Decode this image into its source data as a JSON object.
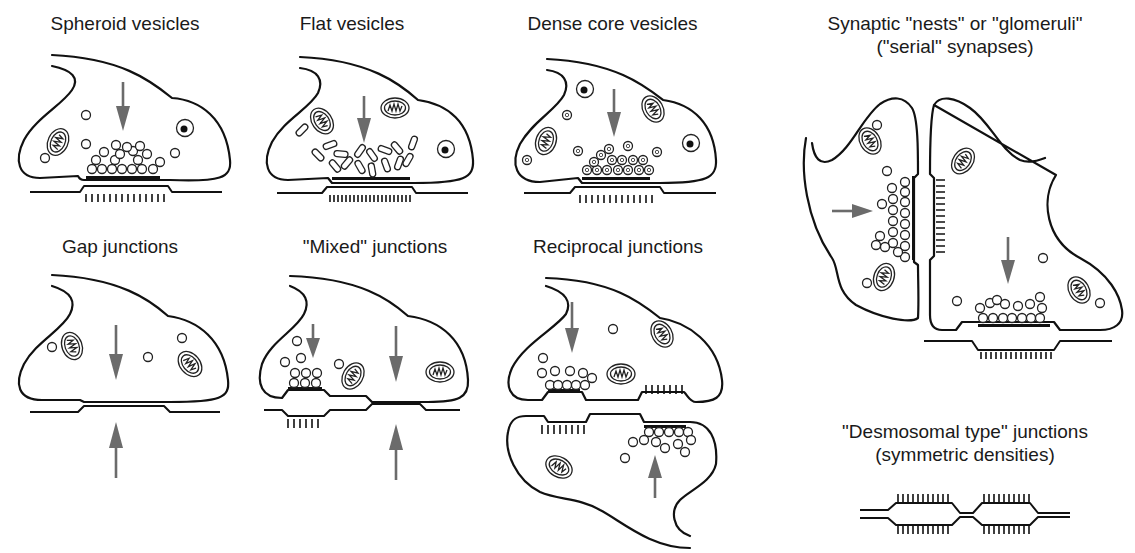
{
  "figure": {
    "type": "synaptic junction types schematic",
    "colors": {
      "outline": "#111111",
      "arrow": "#6b6b6b",
      "background": "#ffffff"
    }
  },
  "panels": [
    {
      "id": "spheroid",
      "title": "Spheroid vesicles"
    },
    {
      "id": "flat",
      "title": "Flat vesicles"
    },
    {
      "id": "dense-core",
      "title": "Dense core vesicles"
    },
    {
      "id": "nests",
      "title_line1": "Synaptic \"nests\" or \"glomeruli\"",
      "title_line2": "(\"serial\" synapses)"
    },
    {
      "id": "gap",
      "title": "Gap junctions"
    },
    {
      "id": "mixed",
      "title": "\"Mixed\" junctions"
    },
    {
      "id": "reciprocal",
      "title": "Reciprocal junctions"
    },
    {
      "id": "desmosomal",
      "title_line1": "\"Desmosomal type\" junctions",
      "title_line2": "(symmetric densities)"
    }
  ]
}
